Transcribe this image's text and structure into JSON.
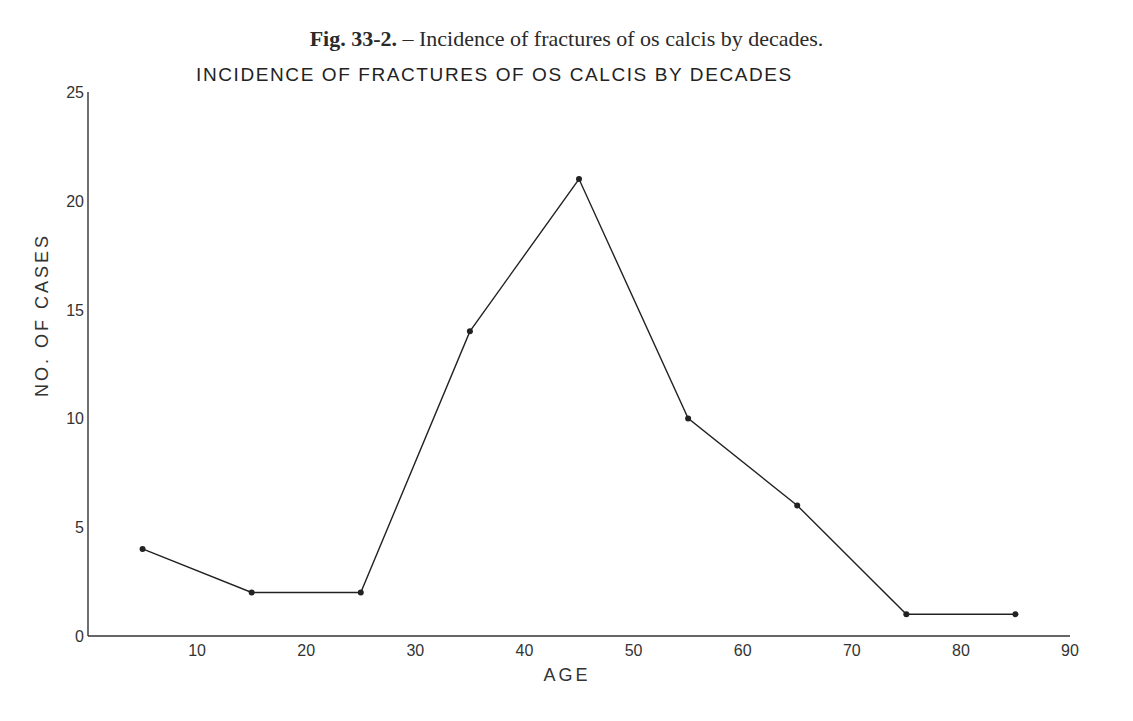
{
  "caption": {
    "fig_label": "Fig. 33-2.",
    "text": " – Incidence of fractures of os calcis by decades."
  },
  "chart_data": {
    "type": "line",
    "title": "INCIDENCE OF FRACTURES OF OS CALCIS BY DECADES",
    "xlabel": "AGE",
    "ylabel": "NO. OF CASES",
    "xlim": [
      0,
      90
    ],
    "ylim": [
      0,
      25
    ],
    "x_ticks": [
      10,
      20,
      30,
      40,
      50,
      60,
      70,
      80,
      90
    ],
    "y_ticks": [
      0,
      5,
      10,
      15,
      20,
      25
    ],
    "grid": false,
    "legend": null,
    "series": [
      {
        "name": "Fractures of os calcis",
        "x": [
          5,
          15,
          25,
          35,
          45,
          55,
          65,
          75,
          85
        ],
        "values": [
          4,
          2,
          2,
          14,
          21,
          10,
          6,
          1,
          1
        ]
      }
    ]
  },
  "colors": {
    "line": "#222222",
    "axis": "#333333",
    "background": "#ffffff"
  }
}
